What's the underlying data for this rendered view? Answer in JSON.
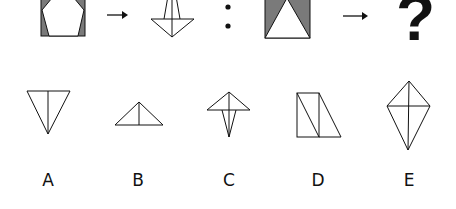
{
  "puzzle": {
    "top_row": {
      "first_pair": {
        "source": "square-with-gray-corners-and-white-pentagon",
        "result": "folded-kite-shape"
      },
      "separator": ":",
      "second_pair": {
        "source": "rectangle-with-gray-sides-and-white-triangle",
        "result": "?"
      },
      "arrow_glyph": "→",
      "question_mark": "?"
    },
    "options": [
      {
        "label": "A",
        "shape": "inverted-triangle-with-center-line"
      },
      {
        "label": "B",
        "shape": "triangle-with-center-line"
      },
      {
        "label": "C",
        "shape": "triangle-over-narrow-v"
      },
      {
        "label": "D",
        "shape": "rectangle-with-diagonal-plus-trapezoid"
      },
      {
        "label": "E",
        "shape": "kite-with-cross-lines"
      }
    ],
    "colors": {
      "stroke": "#111111",
      "gray_fill": "#7a7a7a",
      "background": "#ffffff"
    }
  }
}
